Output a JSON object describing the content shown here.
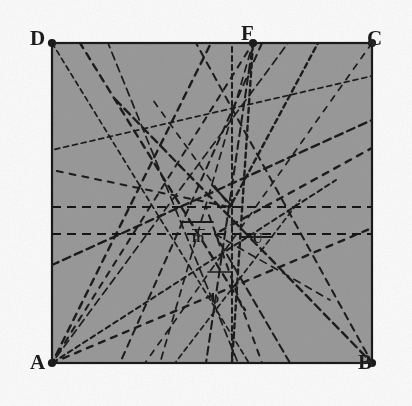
{
  "figure": {
    "kind": "scanned-geometry-diagram",
    "canvas": {
      "width": 412,
      "height": 406
    },
    "background_color": "#fbfbfb",
    "fill_color": "#9a9a9a",
    "stroke_color": "#1b1b1b",
    "square": {
      "name": "ABCD",
      "left": 52,
      "top": 43,
      "right": 372,
      "bottom": 363,
      "border_width": 2.2
    },
    "vertices": [
      {
        "id": "D",
        "label": "D",
        "x": 52,
        "y": 43,
        "label_x": 30,
        "label_y": 28,
        "dot": true
      },
      {
        "id": "C",
        "label": "C",
        "x": 372,
        "y": 43,
        "label_x": 367,
        "label_y": 28,
        "dot": true
      },
      {
        "id": "A",
        "label": "A",
        "x": 52,
        "y": 363,
        "label_x": 30,
        "label_y": 352,
        "dot": true
      },
      {
        "id": "B",
        "label": "B",
        "x": 372,
        "y": 363,
        "label_x": 358,
        "label_y": 352,
        "dot": true
      },
      {
        "id": "F",
        "label": "F",
        "x": 253,
        "y": 43,
        "label_x": 241,
        "label_y": 23,
        "dot": true
      }
    ],
    "inner_labels": [
      {
        "id": "m",
        "label": "m",
        "x": 192,
        "y": 229,
        "overline": true
      },
      {
        "id": "U",
        "label": "U",
        "x": 252,
        "y": 231,
        "overline": false
      },
      {
        "id": "b",
        "label": "b",
        "x": 211,
        "y": 291,
        "overline": false
      }
    ],
    "horizontal_lines": [
      {
        "id": "h1",
        "y": 207,
        "x1": 52,
        "x2": 372,
        "style": "dashed",
        "dash": "9,6",
        "width": 2.1
      },
      {
        "id": "h2",
        "y": 234,
        "x1": 52,
        "x2": 372,
        "style": "dashed",
        "dash": "9,6",
        "width": 2.1
      }
    ],
    "short_segments": [
      {
        "id": "s-m-tick",
        "x1": 181,
        "y1": 222,
        "x2": 213,
        "y2": 222,
        "style": "solid",
        "width": 1.8
      },
      {
        "id": "s-u-tick",
        "x1": 241,
        "y1": 237,
        "x2": 272,
        "y2": 237,
        "style": "solid",
        "width": 1.8
      },
      {
        "id": "s-center-arrow",
        "x1": 212,
        "y1": 185,
        "x2": 232,
        "y2": 206,
        "style": "solid",
        "width": 2.0
      },
      {
        "id": "s-b-stub",
        "x1": 208,
        "y1": 272,
        "x2": 232,
        "y2": 272,
        "style": "solid",
        "width": 1.6
      }
    ],
    "dashed_lines": [
      {
        "id": "L01",
        "x1": 52,
        "y1": 43,
        "x2": 249,
        "y2": 363
      },
      {
        "id": "L02",
        "x1": 52,
        "y1": 363,
        "x2": 253,
        "y2": 43
      },
      {
        "id": "L03",
        "x1": 52,
        "y1": 363,
        "x2": 211,
        "y2": 43
      },
      {
        "id": "L04",
        "x1": 52,
        "y1": 363,
        "x2": 288,
        "y2": 43
      },
      {
        "id": "L05",
        "x1": 52,
        "y1": 363,
        "x2": 336,
        "y2": 180
      },
      {
        "id": "L06",
        "x1": 52,
        "y1": 363,
        "x2": 372,
        "y2": 228
      },
      {
        "id": "L07",
        "x1": 253,
        "y1": 43,
        "x2": 160,
        "y2": 363
      },
      {
        "id": "L08",
        "x1": 253,
        "y1": 43,
        "x2": 206,
        "y2": 363
      },
      {
        "id": "L09",
        "x1": 253,
        "y1": 43,
        "x2": 232,
        "y2": 363
      },
      {
        "id": "L10",
        "x1": 372,
        "y1": 43,
        "x2": 145,
        "y2": 363
      },
      {
        "id": "L11",
        "x1": 372,
        "y1": 363,
        "x2": 196,
        "y2": 43
      },
      {
        "id": "L12",
        "x1": 372,
        "y1": 363,
        "x2": 112,
        "y2": 96
      },
      {
        "id": "L13",
        "x1": 52,
        "y1": 150,
        "x2": 372,
        "y2": 76
      },
      {
        "id": "L14",
        "x1": 52,
        "y1": 170,
        "x2": 230,
        "y2": 207
      },
      {
        "id": "L15",
        "x1": 80,
        "y1": 43,
        "x2": 245,
        "y2": 310
      },
      {
        "id": "L16",
        "x1": 108,
        "y1": 43,
        "x2": 238,
        "y2": 363
      },
      {
        "id": "L17",
        "x1": 232,
        "y1": 43,
        "x2": 232,
        "y2": 363
      },
      {
        "id": "L18",
        "x1": 215,
        "y1": 234,
        "x2": 372,
        "y2": 148
      },
      {
        "id": "L19",
        "x1": 215,
        "y1": 234,
        "x2": 330,
        "y2": 300
      },
      {
        "id": "L20",
        "x1": 215,
        "y1": 234,
        "x2": 290,
        "y2": 363
      },
      {
        "id": "L21",
        "x1": 230,
        "y1": 207,
        "x2": 318,
        "y2": 43
      },
      {
        "id": "L22",
        "x1": 230,
        "y1": 207,
        "x2": 150,
        "y2": 96
      },
      {
        "id": "L23",
        "x1": 120,
        "y1": 363,
        "x2": 262,
        "y2": 43
      },
      {
        "id": "L24",
        "x1": 52,
        "y1": 265,
        "x2": 372,
        "y2": 120
      },
      {
        "id": "L25",
        "x1": 175,
        "y1": 363,
        "x2": 300,
        "y2": 200
      },
      {
        "id": "L26",
        "x1": 262,
        "y1": 363,
        "x2": 206,
        "y2": 207
      }
    ]
  }
}
